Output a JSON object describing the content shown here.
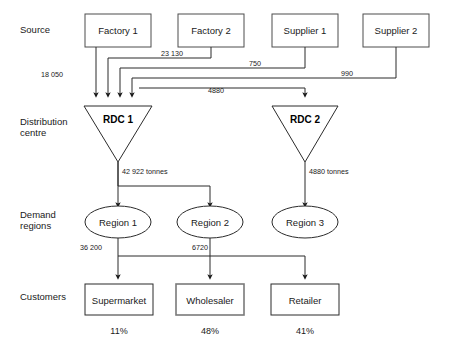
{
  "diagram": {
    "row_labels": [
      {
        "id": "source",
        "line1": "Source",
        "line2": ""
      },
      {
        "id": "distribution-centre",
        "line1": "Distribution",
        "line2": "centre"
      },
      {
        "id": "demand-regions",
        "line1": "Demand",
        "line2": "regions"
      },
      {
        "id": "customers",
        "line1": "Customers",
        "line2": ""
      }
    ],
    "sources": [
      {
        "id": "factory-1",
        "label": "Factory 1"
      },
      {
        "id": "factory-2",
        "label": "Factory 2"
      },
      {
        "id": "supplier-1",
        "label": "Supplier 1"
      },
      {
        "id": "supplier-2",
        "label": "Supplier 2"
      }
    ],
    "distribution_centres": [
      {
        "id": "rdc-1",
        "label": "RDC 1"
      },
      {
        "id": "rdc-2",
        "label": "RDC 2"
      }
    ],
    "regions": [
      {
        "id": "region-1",
        "label": "Region 1"
      },
      {
        "id": "region-2",
        "label": "Region 2"
      },
      {
        "id": "region-3",
        "label": "Region 3"
      }
    ],
    "customers": [
      {
        "id": "supermarket",
        "label": "Supermarket",
        "percent": "11%"
      },
      {
        "id": "wholesaler",
        "label": "Wholesaler",
        "percent": "48%"
      },
      {
        "id": "retailer",
        "label": "Retailer",
        "percent": "41%"
      }
    ],
    "flows": {
      "factory1_to_rdc1": "18 050",
      "factory2_to_rdc1": "23 130",
      "supplier1_to_rdc1": "750",
      "supplier2_to_rdc1": "990",
      "to_rdc2": "4880",
      "rdc1_out": "42 922 tonnes",
      "rdc2_out": "4880 tonnes",
      "region1_out": "36 200",
      "region2_out": "6720"
    },
    "colors": {
      "line": "#2b2b2b",
      "text": "#1a1a1a",
      "background": "#ffffff"
    }
  }
}
